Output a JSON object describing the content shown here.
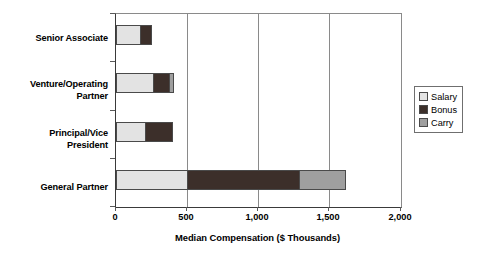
{
  "chart_data": {
    "type": "bar",
    "orientation": "horizontal",
    "stacked": true,
    "title": "",
    "xlabel": "Median Compensation ($ Thousands)",
    "ylabel": "",
    "xlim": [
      0,
      2000
    ],
    "xticks": [
      0,
      500,
      1000,
      1500,
      2000
    ],
    "xticklabels": [
      "0",
      "500",
      "1,000",
      "1,500",
      "2,000"
    ],
    "grid": "vertical",
    "legend_position": "right",
    "categories": [
      "Senior Associate",
      "Venture/Operating Partner",
      "Principal/Vice President",
      "General Partner"
    ],
    "series": [
      {
        "name": "Salary",
        "color": "#e3e3e3",
        "values": [
          170,
          260,
          200,
          500
        ]
      },
      {
        "name": "Bonus",
        "color": "#3c2f2a",
        "values": [
          80,
          115,
          200,
          785
        ]
      },
      {
        "name": "Carry",
        "color": "#9f9f9f",
        "values": [
          0,
          35,
          0,
          330
        ]
      }
    ],
    "totals": [
      250,
      410,
      400,
      1615
    ]
  },
  "axis": {
    "x_title": "Median Compensation ($ Thousands)",
    "tick_labels": [
      "0",
      "500",
      "1,000",
      "1,500",
      "2,000"
    ],
    "category_labels": [
      {
        "line1": "Senior Associate",
        "line2": ""
      },
      {
        "line1": "Venture/Operating",
        "line2": "Partner"
      },
      {
        "line1": "Principal/Vice",
        "line2": "President"
      },
      {
        "line1": "General Partner",
        "line2": ""
      }
    ]
  },
  "legend": {
    "items": [
      {
        "label": "Salary",
        "color": "#e3e3e3"
      },
      {
        "label": "Bonus",
        "color": "#3c2f2a"
      },
      {
        "label": "Carry",
        "color": "#9f9f9f"
      }
    ]
  }
}
